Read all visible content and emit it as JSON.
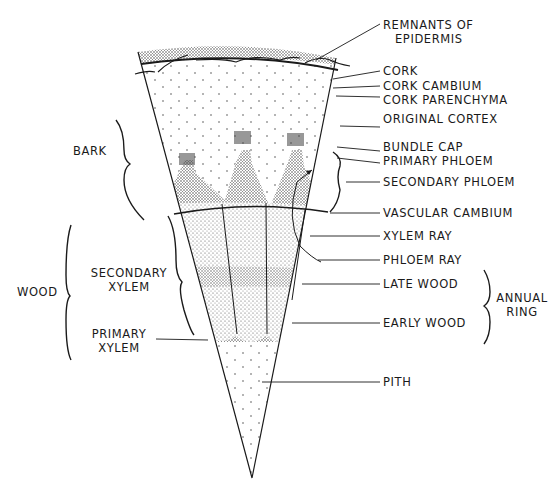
{
  "diagram": {
    "colors": {
      "ink": "#1a1a1a",
      "stipple_dark": "#555555",
      "stipple_light": "#9a9a9a",
      "background": "#ffffff"
    },
    "right_labels": [
      {
        "id": "remnants",
        "line1": "REMNANTS OF",
        "line2": "EPIDERMIS"
      },
      {
        "id": "cork",
        "text": "CORK"
      },
      {
        "id": "cork-cambium",
        "text": "CORK CAMBIUM"
      },
      {
        "id": "cork-parenchyma",
        "text": "CORK PARENCHYMA"
      },
      {
        "id": "original-cortex",
        "text": "ORIGINAL CORTEX"
      },
      {
        "id": "bundle-cap",
        "text": "BUNDLE CAP"
      },
      {
        "id": "primary-phloem",
        "text": "PRIMARY PHLOEM"
      },
      {
        "id": "secondary-phloem",
        "text": "SECONDARY PHLOEM"
      },
      {
        "id": "vascular-cambium",
        "text": "VASCULAR CAMBIUM"
      },
      {
        "id": "xylem-ray",
        "text": "XYLEM RAY"
      },
      {
        "id": "phloem-ray",
        "text": "PHLOEM RAY"
      },
      {
        "id": "late-wood",
        "text": "LATE WOOD"
      },
      {
        "id": "early-wood",
        "text": "EARLY WOOD"
      },
      {
        "id": "pith",
        "text": "PITH"
      }
    ],
    "annual_ring": {
      "line1": "ANNUAL",
      "line2": "RING"
    },
    "left_labels": {
      "bark": "BARK",
      "wood": "WOOD",
      "secondary_xylem": {
        "line1": "SECONDARY",
        "line2": "XYLEM"
      },
      "primary_xylem": {
        "line1": "PRIMARY",
        "line2": "XYLEM"
      }
    }
  }
}
